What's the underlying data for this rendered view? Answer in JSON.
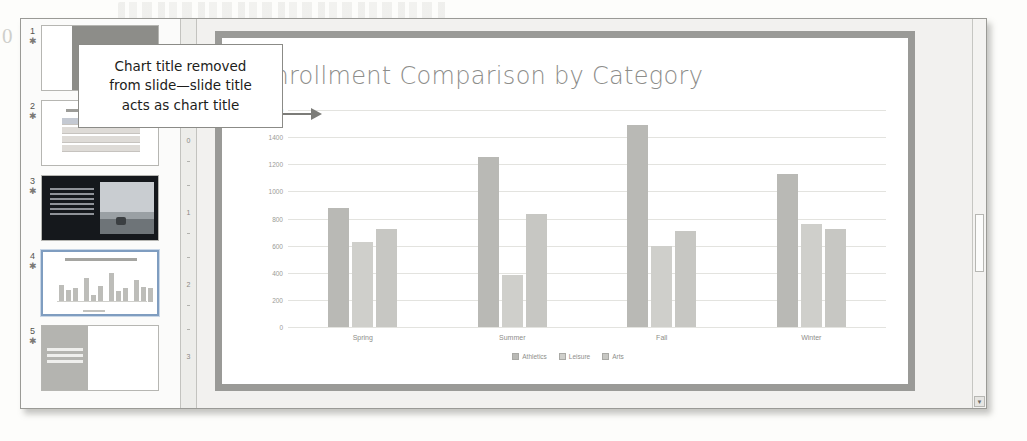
{
  "page": {
    "artifact_number": "0"
  },
  "callout": {
    "lines": [
      "Chart title removed",
      "from slide—slide title",
      "acts as chart title"
    ],
    "arrow_icon": "right-arrow-icon"
  },
  "thumbnails": {
    "items": [
      {
        "number": "1",
        "star": "✱",
        "selected": false
      },
      {
        "number": "2",
        "star": "✱",
        "selected": false
      },
      {
        "number": "3",
        "star": "✱",
        "selected": false
      },
      {
        "number": "4",
        "star": "✱",
        "selected": true
      },
      {
        "number": "5",
        "star": "✱",
        "selected": false
      }
    ]
  },
  "ruler": {
    "marks": [
      "1",
      "0",
      "1",
      "2",
      "3"
    ]
  },
  "slide": {
    "title": "Enrollment Comparison by Category"
  },
  "scrollbar": {
    "down_arrow": "▼"
  },
  "chart_data": {
    "type": "bar",
    "title": "Enrollment Comparison by Category",
    "xlabel": "",
    "ylabel": "",
    "ylim": [
      0,
      1600
    ],
    "yticks": [
      0,
      200,
      400,
      600,
      800,
      1000,
      1200,
      1400,
      1600
    ],
    "ytick_labels": [
      "0",
      "200",
      "400",
      "600",
      "800",
      "1000",
      "1200",
      "1400",
      "1600"
    ],
    "grid": true,
    "legend_position": "bottom",
    "categories": [
      "Spring",
      "Summer",
      "Fall",
      "Winter"
    ],
    "series": [
      {
        "name": "Athletics",
        "color": "#b9b9b5",
        "values": [
          880,
          1250,
          1490,
          1130
        ]
      },
      {
        "name": "Leisure",
        "color": "#cfcfcb",
        "values": [
          630,
          380,
          600,
          760
        ]
      },
      {
        "name": "Arts",
        "color": "#c7c7c3",
        "values": [
          720,
          830,
          710,
          720
        ]
      }
    ]
  }
}
